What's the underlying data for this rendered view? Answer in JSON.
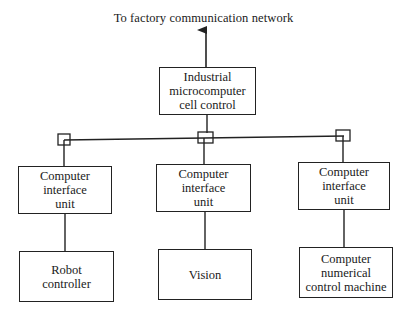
{
  "diagram": {
    "network_label": "To factory communication network",
    "cell_control": {
      "lines": [
        "Industrial",
        "microcomputer",
        "cell control"
      ]
    },
    "interface_units": [
      {
        "lines": [
          "Computer",
          "interface",
          "unit"
        ]
      },
      {
        "lines": [
          "Computer",
          "interface",
          "unit"
        ]
      },
      {
        "lines": [
          "Computer",
          "interface",
          "unit"
        ]
      }
    ],
    "devices": [
      {
        "lines": [
          "Robot",
          "controller"
        ]
      },
      {
        "lines": [
          "Vision"
        ]
      },
      {
        "lines": [
          "Computer",
          "numerical",
          "control machine"
        ]
      }
    ],
    "line_color": "#222222",
    "background": "#ffffff"
  }
}
